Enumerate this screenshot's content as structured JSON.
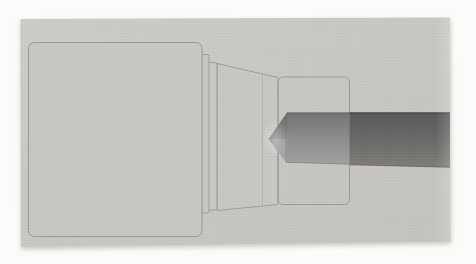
{
  "figure": {
    "alt": "Scanned grayscale CAD rendering of a lathe spindle assembly: a large block housing on the left, two stepped flange discs, a tapered cone section, a translucent sleeve drawn in outline, and a dark cylindrical bar with a pointed chamfered tip inserted from the right side.",
    "components": [
      {
        "name": "block-housing"
      },
      {
        "name": "flange-disc-outer"
      },
      {
        "name": "flange-disc-inner"
      },
      {
        "name": "taper-cone"
      },
      {
        "name": "sleeve-outline"
      },
      {
        "name": "workpiece-bar"
      },
      {
        "name": "bar-pointed-tip"
      }
    ],
    "colors": {
      "page_bg": "#fbfbf9",
      "scan_light": "#cccbc7",
      "scan_dark": "#c4c3c0",
      "scan_fill": "#c8c7c4",
      "outline": "#908f8c",
      "outline_faint": "#aeada9",
      "shadow": "#8a887f",
      "bar_front_top": "#737371",
      "bar_front_mid": "#8a898c",
      "bar_front_bottom": "#a3a19e",
      "bar_rear_top": "#59595b",
      "bar_rear_mid": "#6b6b69",
      "bar_rear_bottom": "#7f7d7a",
      "bar_edge_dark": "#45454a",
      "tip_highlight": "#ffffff",
      "noise_dark": "#000000",
      "noise_light": "#ffffff"
    }
  }
}
